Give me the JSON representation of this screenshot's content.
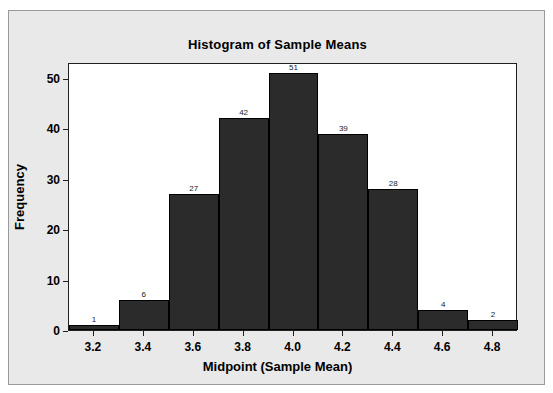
{
  "chart_data": {
    "type": "bar",
    "title": "Histogram of Sample Means",
    "xlabel": "Midpoint (Sample Mean)",
    "ylabel": "Frequency",
    "categories": [
      "3.2",
      "3.4",
      "3.6",
      "3.8",
      "4.0",
      "4.2",
      "4.4",
      "4.6",
      "4.8"
    ],
    "values": [
      1,
      6,
      27,
      42,
      51,
      39,
      28,
      4,
      2
    ],
    "bar_labels": [
      "1",
      "6",
      "27",
      "42",
      "51",
      "39",
      "28",
      "4",
      "2"
    ],
    "xticks": [
      "3.2",
      "3.4",
      "3.6",
      "3.8",
      "4.0",
      "4.2",
      "4.4",
      "4.6",
      "4.8"
    ],
    "yticks": [
      "0",
      "10",
      "20",
      "30",
      "40",
      "50"
    ],
    "ytick_values": [
      0,
      10,
      20,
      30,
      40,
      50
    ],
    "ylim": [
      0,
      53.2
    ],
    "xlim": [
      3.1,
      4.9
    ],
    "bin_width": 0.2,
    "grid": false,
    "legend": false,
    "bar_color": "#2b2b2b",
    "bar_edge_color": "#000000",
    "plot_background": "#ffffff",
    "panel_background": "#e9e9e9",
    "axis_color": "#231f20",
    "total_count": 200
  }
}
